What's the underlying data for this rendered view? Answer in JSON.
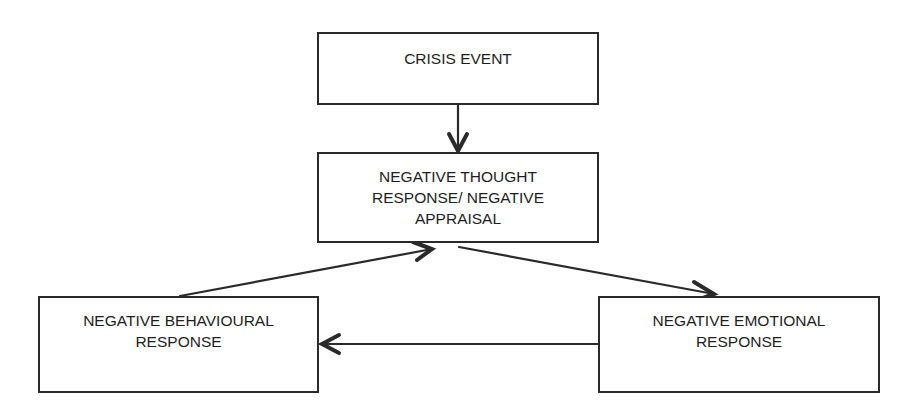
{
  "diagram": {
    "type": "flowchart",
    "nodes": [
      {
        "id": "crisis",
        "lines": [
          "CRISIS EVENT"
        ]
      },
      {
        "id": "thought",
        "lines": [
          "NEGATIVE THOUGHT",
          "RESPONSE/ NEGATIVE",
          "APPRAISAL"
        ]
      },
      {
        "id": "behaviour",
        "lines": [
          "NEGATIVE BEHAVIOURAL",
          "RESPONSE"
        ]
      },
      {
        "id": "emotion",
        "lines": [
          "NEGATIVE EMOTIONAL",
          "RESPONSE"
        ]
      }
    ],
    "edges": [
      {
        "from": "crisis",
        "to": "thought"
      },
      {
        "from": "thought",
        "to": "emotion"
      },
      {
        "from": "emotion",
        "to": "behaviour"
      },
      {
        "from": "behaviour",
        "to": "thought"
      }
    ],
    "colors": {
      "stroke": "#2a2a2a",
      "text": "#1e1e1e",
      "background": "#ffffff"
    }
  }
}
